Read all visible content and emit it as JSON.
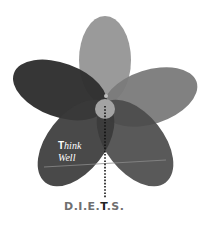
{
  "diagram": {
    "type": "flower",
    "petals": [
      {
        "id": "top",
        "color": "#9a9a9a"
      },
      {
        "id": "left",
        "color": "#2f2f2f"
      },
      {
        "id": "right",
        "color": "#7a7a7a"
      },
      {
        "id": "bottom-left",
        "color": "#3a3a3a"
      },
      {
        "id": "bottom-right",
        "color": "#4b4b4b"
      }
    ],
    "center_color": "#a3a3a3",
    "label": {
      "line1_cap": "T",
      "line1_rest": "hink",
      "line2": "Well"
    },
    "caption": {
      "part1": "D.I.E.",
      "highlight": "T",
      "part2": ".S."
    }
  }
}
